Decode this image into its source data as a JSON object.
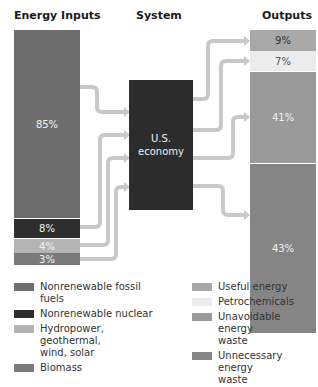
{
  "headers": {
    "inputs": "Energy Inputs",
    "system": "System",
    "outputs": "Outputs"
  },
  "system_box": {
    "line1": "U.S.",
    "line2": "economy"
  },
  "inputs": [
    {
      "label": "85%",
      "name": "Nonrenewable fossil fuels",
      "color": "#6e6e6e"
    },
    {
      "label": "8%",
      "name": "Nonrenewable nuclear",
      "color": "#2e2e2e"
    },
    {
      "label": "4%",
      "name": "Hydropower, geothermal, wind, solar",
      "color": "#b4b4b4"
    },
    {
      "label": "3%",
      "name": "Biomass",
      "color": "#7a7a7a"
    }
  ],
  "outputs": [
    {
      "label": "9%",
      "name": "Useful energy",
      "color": "#a8a8a8"
    },
    {
      "label": "7%",
      "name": "Petrochemicals",
      "color": "#ececec"
    },
    {
      "label": "41%",
      "name": "Unavoidable energy waste",
      "color": "#9a9a9a"
    },
    {
      "label": "43%",
      "name": "Unnecessary energy waste",
      "color": "#858585"
    }
  ],
  "legend_left": [
    {
      "label": "Nonrenewable fossil fuels",
      "color": "#6e6e6e"
    },
    {
      "label": "Nonrenewable nuclear",
      "color": "#2e2e2e"
    },
    {
      "label": "Hydropower, geothermal,",
      "label2": "wind, solar",
      "color": "#b4b4b4"
    },
    {
      "label": "Biomass",
      "color": "#7a7a7a"
    }
  ],
  "legend_right": [
    {
      "label": "Useful energy",
      "color": "#a8a8a8"
    },
    {
      "label": "Petrochemicals",
      "color": "#ececec"
    },
    {
      "label": "Unavoidable energy",
      "label2": "waste",
      "color": "#9a9a9a"
    },
    {
      "label": "Unnecessary energy",
      "label2": "waste",
      "color": "#858585"
    }
  ],
  "flow_color": "#c8c8c8"
}
